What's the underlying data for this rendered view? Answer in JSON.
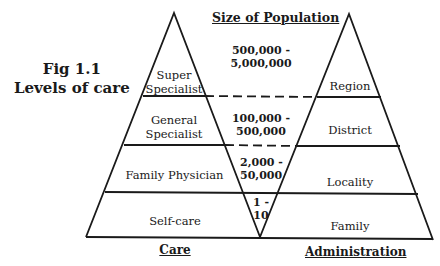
{
  "figure": {
    "number": "Fig 1.1",
    "caption": "Levels of care"
  },
  "headers": {
    "population": "Size of Population",
    "care": "Care",
    "administration": "Administration"
  },
  "levels": [
    {
      "care": [
        "Super",
        "Specialist"
      ],
      "population": [
        "500,000 -",
        "5,000,000"
      ],
      "administration": "Region"
    },
    {
      "care": [
        "General",
        "Specialist"
      ],
      "population": [
        "100,000 -",
        "500,000"
      ],
      "administration": "District"
    },
    {
      "care": [
        "Family Physician"
      ],
      "population": [
        "2,000 -",
        "50,000"
      ],
      "administration": "Locality"
    },
    {
      "care": [
        "Self-care"
      ],
      "population": [
        "1 -",
        "10"
      ],
      "administration": "Family"
    }
  ],
  "colors": {
    "ink": "#1a1a1a",
    "background": "#ffffff"
  }
}
